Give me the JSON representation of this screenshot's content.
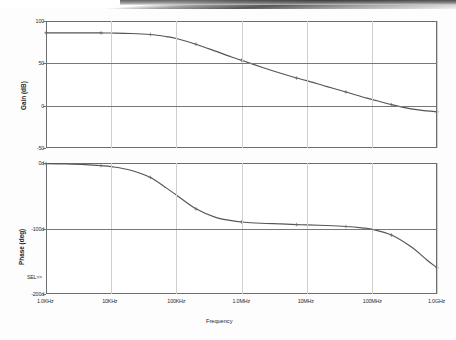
{
  "document": {
    "kind": "bode-plot-scan",
    "background_color": "#fdfdfd",
    "trace_color": "#555555",
    "frame_color": "#6e6e6e",
    "grid_color": "#cfcfcf"
  },
  "axes": {
    "x_title": "Frequency",
    "x_scale": "log",
    "x_min_hz": 1000,
    "x_max_hz": 1000000000,
    "x_ticks": [
      {
        "label": "1.0KHz",
        "hz": 1000
      },
      {
        "label": "10KHz",
        "hz": 10000
      },
      {
        "label": "100KHz",
        "hz": 100000
      },
      {
        "label": "1.0MHz",
        "hz": 1000000
      },
      {
        "label": "10MHz",
        "hz": 10000000
      },
      {
        "label": "100MHz",
        "hz": 100000000
      },
      {
        "label": "1.0GHz",
        "hz": 1000000000
      }
    ]
  },
  "gain_panel": {
    "y_title": "Gain (dB)",
    "y_ticks": [
      "100",
      "50",
      "0",
      "-50"
    ],
    "y_min": -50,
    "y_max": 100
  },
  "phase_panel": {
    "y_title": "Phase (deg)",
    "y_ticks": [
      "0d",
      "-100d",
      "-200d"
    ],
    "y_min": -200,
    "y_max": 0,
    "sel_marker": "SEL>>"
  },
  "chart_data": {
    "type": "line",
    "title": "",
    "xlabel": "Frequency",
    "charts": [
      {
        "name": "gain",
        "ylabel": "Gain (dB)",
        "ylim": [
          -50,
          100
        ],
        "xlim": [
          1000,
          1000000000
        ],
        "xscale": "log",
        "grid": true,
        "legend": "none",
        "series": [
          {
            "name": "Gain",
            "x": [
              1000,
              2000,
              4000,
              7000,
              10000,
              20000,
              40000,
              70000,
              100000,
              200000,
              400000,
              700000,
              1000000,
              2000000,
              4000000,
              7000000,
              10000000,
              20000000,
              40000000,
              70000000,
              100000000,
              200000000,
              400000000,
              700000000,
              1000000000
            ],
            "y": [
              86.0,
              86.0,
              86.0,
              85.9,
              85.8,
              85.3,
              84.0,
              81.6,
              79.4,
              72.6,
              64.4,
              57.5,
              53.6,
              45.7,
              38.2,
              32.6,
              29.6,
              22.8,
              16.2,
              10.6,
              7.5,
              1.2,
              -3.8,
              -6.2,
              -7.3
            ]
          }
        ]
      },
      {
        "name": "phase",
        "ylabel": "Phase (deg)",
        "ylim": [
          -200,
          0
        ],
        "xlim": [
          1000,
          1000000000
        ],
        "xscale": "log",
        "grid": true,
        "legend": "none",
        "series": [
          {
            "name": "Phase",
            "x": [
              1000,
              2000,
              4000,
              7000,
              10000,
              20000,
              40000,
              70000,
              100000,
              200000,
              400000,
              700000,
              1000000,
              2000000,
              4000000,
              7000000,
              10000000,
              20000000,
              40000000,
              70000000,
              100000000,
              200000000,
              400000000,
              700000000,
              1000000000
            ],
            "y": [
              -1.0,
              -1.5,
              -2.5,
              -4.0,
              -5.5,
              -11.0,
              -22.0,
              -38.0,
              -49.0,
              -70.0,
              -83.0,
              -88.0,
              -90.0,
              -92.0,
              -93.0,
              -94.0,
              -94.5,
              -95.5,
              -97.0,
              -99.0,
              -101.0,
              -110.0,
              -128.0,
              -148.0,
              -160.0
            ]
          }
        ]
      }
    ]
  }
}
